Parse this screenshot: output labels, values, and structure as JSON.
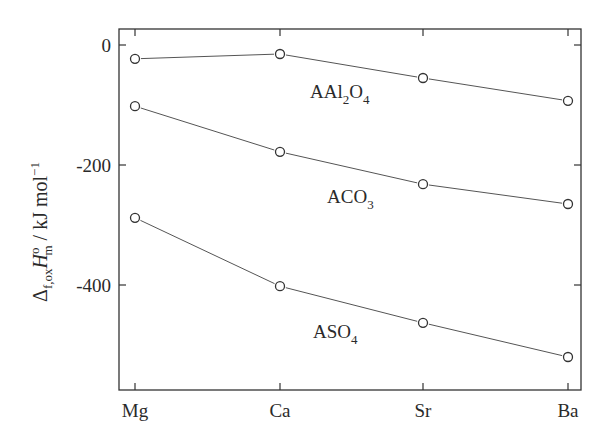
{
  "chart_data": {
    "type": "line",
    "title": "",
    "xlabel": "",
    "ylabel": "Δf,oxH°m / kJ mol⁻¹",
    "ylabel_parts": {
      "delta": "Δ",
      "delta_sub": "f,ox",
      "H": "H",
      "H_sup": "o",
      "H_sub": "m",
      "units": " / kJ mol",
      "units_sup": "−1"
    },
    "categories": [
      "Mg",
      "Ca",
      "Sr",
      "Ba"
    ],
    "yticks": [
      0,
      -200,
      -400
    ],
    "ytick_labels": [
      "0",
      "-200",
      "-400"
    ],
    "ylim": [
      -575,
      25
    ],
    "grid": false,
    "legend": "inline labels",
    "series": [
      {
        "name": "AAl2O4",
        "label_main": "AAl",
        "label_sub1": "2",
        "label_mid": "O",
        "label_sub2": "4",
        "values": [
          -23,
          -15,
          -55,
          -93
        ]
      },
      {
        "name": "ACO3",
        "label_main": "ACO",
        "label_sub1": "3",
        "label_mid": "",
        "label_sub2": "",
        "values": [
          -102,
          -178,
          -232,
          -265
        ]
      },
      {
        "name": "ASO4",
        "label_main": "ASO",
        "label_sub1": "4",
        "label_mid": "",
        "label_sub2": "",
        "values": [
          -288,
          -402,
          -463,
          -520
        ]
      }
    ]
  }
}
